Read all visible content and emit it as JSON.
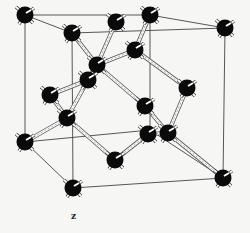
{
  "figure": {
    "title": "",
    "axis_label": "z",
    "colors": {
      "atom": "#0a0a0a",
      "edge": "#444444",
      "bond": "#fafafa",
      "background": "#f6f6f4"
    },
    "cube_corners": {
      "back_top_left": [
        25,
        15
      ],
      "back_top_right": [
        150,
        15
      ],
      "front_top_left": [
        72,
        33
      ],
      "front_top_right": [
        225,
        28
      ],
      "back_bottom_left": [
        25,
        142
      ],
      "back_bottom_right": [
        150,
        130
      ],
      "front_bottom_left": [
        73,
        188
      ],
      "front_bottom_right": [
        223,
        178
      ]
    },
    "atoms": [
      {
        "id": "a1",
        "x": 25,
        "y": 15
      },
      {
        "id": "a2",
        "x": 72,
        "y": 33
      },
      {
        "id": "a3",
        "x": 116,
        "y": 22
      },
      {
        "id": "a4",
        "x": 150,
        "y": 15
      },
      {
        "id": "a5",
        "x": 225,
        "y": 28
      },
      {
        "id": "a6",
        "x": 135,
        "y": 50
      },
      {
        "id": "a7",
        "x": 97,
        "y": 65
      },
      {
        "id": "a8",
        "x": 88,
        "y": 80
      },
      {
        "id": "a9",
        "x": 50,
        "y": 95
      },
      {
        "id": "a10",
        "x": 187,
        "y": 88
      },
      {
        "id": "a11",
        "x": 145,
        "y": 106
      },
      {
        "id": "a12",
        "x": 67,
        "y": 118
      },
      {
        "id": "a13",
        "x": 148,
        "y": 134
      },
      {
        "id": "a14",
        "x": 168,
        "y": 133
      },
      {
        "id": "a15",
        "x": 25,
        "y": 142
      },
      {
        "id": "a16",
        "x": 115,
        "y": 160
      },
      {
        "id": "a17",
        "x": 73,
        "y": 188
      },
      {
        "id": "a18",
        "x": 223,
        "y": 178
      }
    ],
    "bonds": [
      [
        "a3",
        "a7"
      ],
      [
        "a6",
        "a7"
      ],
      [
        "a6",
        "a4"
      ],
      [
        "a6",
        "a10"
      ],
      [
        "a7",
        "a8"
      ],
      [
        "a8",
        "a9"
      ],
      [
        "a8",
        "a12"
      ],
      [
        "a9",
        "a12"
      ],
      [
        "a7",
        "a11"
      ],
      [
        "a11",
        "a14"
      ],
      [
        "a10",
        "a14"
      ],
      [
        "a14",
        "a18"
      ],
      [
        "a12",
        "a15"
      ],
      [
        "a12",
        "a16"
      ],
      [
        "a13",
        "a16"
      ],
      [
        "a13",
        "a14"
      ],
      [
        "a2",
        "a7"
      ]
    ]
  }
}
